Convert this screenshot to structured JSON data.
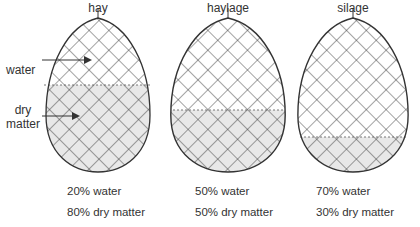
{
  "diagram": {
    "bales": [
      {
        "name": "hay",
        "water": "20% water",
        "dry": "80% dry matter",
        "water_pct": 20
      },
      {
        "name": "haylage",
        "water": "50% water",
        "dry": "50% dry matter",
        "water_pct": 50
      },
      {
        "name": "silage",
        "water": "70% water",
        "dry": "30% dry matter",
        "water_pct": 70
      }
    ],
    "labels": {
      "water": "water",
      "dry_line1": "dry",
      "dry_line2": "matter"
    },
    "colors": {
      "fill": "#e8e8e8",
      "line": "#333333",
      "background": "#ffffff"
    }
  }
}
